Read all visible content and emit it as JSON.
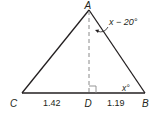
{
  "diagram": {
    "type": "triangle-with-altitude",
    "vertices": {
      "A": {
        "label": "A"
      },
      "B": {
        "label": "B"
      },
      "C": {
        "label": "C"
      },
      "D": {
        "label": "D"
      }
    },
    "segments": {
      "CD": {
        "length_label": "1.42"
      },
      "DB": {
        "length_label": "1.19"
      }
    },
    "angles": {
      "B": {
        "label": "x°"
      },
      "BAD": {
        "label": "x − 20°"
      }
    },
    "colors": {
      "triangle_stroke": "#231f20",
      "altitude_stroke": "#808080",
      "text": "#231f20"
    }
  }
}
